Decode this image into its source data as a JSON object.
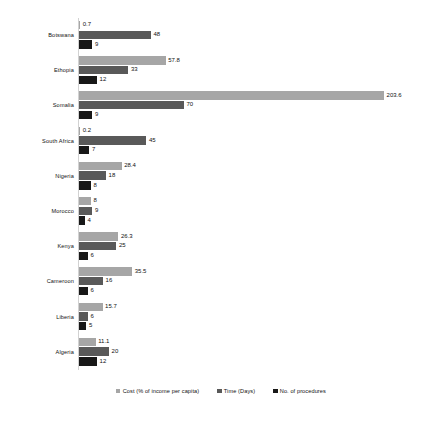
{
  "chart_data": {
    "type": "bar",
    "orientation": "horizontal",
    "title": "",
    "subtitle": "",
    "xlabel": "",
    "ylabel": "",
    "grid": false,
    "legend_position": "bottom",
    "xlim": [
      0,
      203.6
    ],
    "categories": [
      "Botswana",
      "Ethopia",
      "Somalia",
      "South Africa",
      "Nigeria",
      "Morocco",
      "Kenya",
      "Cameroon",
      "Liberia",
      "Algeria"
    ],
    "series": [
      {
        "name": "Cost (% of income per capita)",
        "color": "#a6a6a6",
        "values": [
          0.7,
          57.8,
          203.6,
          0.2,
          28.4,
          8,
          26.3,
          35.5,
          15.7,
          11.1
        ],
        "labels": [
          "0.7",
          "57.8",
          "203.6",
          "0.2",
          "28.4",
          "8",
          "26.3",
          "35.5",
          "15.7",
          "11.1"
        ]
      },
      {
        "name": "Time (Days)",
        "color": "#595959",
        "values": [
          48,
          33,
          70,
          45,
          18,
          9,
          25,
          16,
          6,
          20
        ],
        "labels": [
          "48",
          "33",
          "70",
          "45",
          "18",
          "9",
          "25",
          "16",
          "6",
          "20"
        ]
      },
      {
        "name": "No. of procedures",
        "color": "#181818",
        "values": [
          9,
          12,
          9,
          7,
          8,
          4,
          6,
          6,
          5,
          12
        ],
        "labels": [
          "9",
          "12",
          "9",
          "7",
          "8",
          "4",
          "6",
          "6",
          "5",
          "12"
        ]
      }
    ]
  },
  "legend": {
    "items": [
      {
        "label": "Cost (% of income per capita)",
        "color": "#a6a6a6"
      },
      {
        "label": "Time (Days)",
        "color": "#595959"
      },
      {
        "label": "No. of procedures",
        "color": "#181818"
      }
    ]
  }
}
